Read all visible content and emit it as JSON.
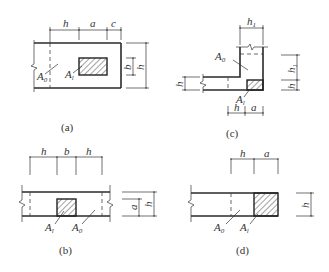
{
  "figure": {
    "panels": [
      {
        "id": "a",
        "caption": "(a)",
        "dimensions_top": [
          "h",
          "a",
          "c"
        ],
        "dimensions_right": [
          "b",
          "h"
        ],
        "area_labels": [
          {
            "base": "A",
            "sub": "0"
          },
          {
            "base": "A",
            "sub": "l"
          }
        ]
      },
      {
        "id": "b",
        "caption": "(b)",
        "dimensions_top": [
          "h",
          "b",
          "h"
        ],
        "dimensions_right": [
          "a",
          "h"
        ],
        "area_labels": [
          {
            "base": "A",
            "sub": "l"
          },
          {
            "base": "A",
            "sub": "0"
          }
        ]
      },
      {
        "id": "c",
        "caption": "(c)",
        "dimensions_top": [
          "h1"
        ],
        "dimensions_top_labels": [
          {
            "base": "h",
            "sub": "1"
          }
        ],
        "dimensions_left": [
          "h"
        ],
        "dimensions_bottom": [
          "h",
          "a"
        ],
        "dimensions_right": [
          {
            "base": "h",
            "sub": "1"
          },
          {
            "base": "h",
            "sub": ""
          }
        ],
        "area_labels": [
          {
            "base": "A",
            "sub": "0"
          },
          {
            "base": "A",
            "sub": "l"
          }
        ]
      },
      {
        "id": "d",
        "caption": "(d)",
        "dimensions_top": [
          "h",
          "a"
        ],
        "dimensions_right": [
          "h"
        ],
        "area_labels": [
          {
            "base": "A",
            "sub": "0"
          },
          {
            "base": "A",
            "sub": "l"
          }
        ]
      }
    ],
    "colors": {
      "line": "#2a2a2a",
      "background": "#ffffff"
    }
  }
}
